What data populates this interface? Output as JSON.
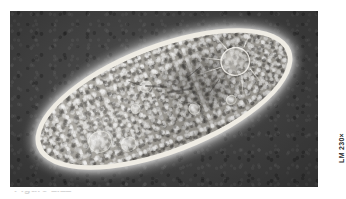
{
  "figure": {
    "kind": "light-micrograph",
    "page_background": "#ffffff"
  },
  "plate": {
    "background_color": "#3b3b3b",
    "field_label": "dark-field background",
    "left": 10,
    "top": 11,
    "width": 308,
    "height": 176
  },
  "organism": {
    "name": "paramecium-cell",
    "shape": "elongated ellipse",
    "rotation_degrees": -21,
    "membrane_color": "#efece4",
    "cytoplasm_color": "#a5a29b",
    "structures": [
      {
        "name": "pellicle-rim",
        "label": "bright cell membrane rim"
      },
      {
        "name": "endoplasm",
        "label": "granular cytoplasm"
      },
      {
        "name": "contractile-vacuole",
        "label": "contractile vacuole with radiating canals"
      },
      {
        "name": "macronucleus",
        "label": "macronucleus shading"
      },
      {
        "name": "oral-groove",
        "label": "gullet / oral groove shading"
      },
      {
        "name": "food-vacuole",
        "label": "food vacuoles"
      }
    ]
  },
  "magnification": {
    "label": "LM 230×",
    "technique": "LM",
    "value": "230",
    "unit": "×",
    "orientation": "rotated-90-ccw",
    "color": "#2b2b2b"
  },
  "caption": {
    "fragment_text": "Figure 1.11",
    "note": "cut off at bottom edge"
  }
}
